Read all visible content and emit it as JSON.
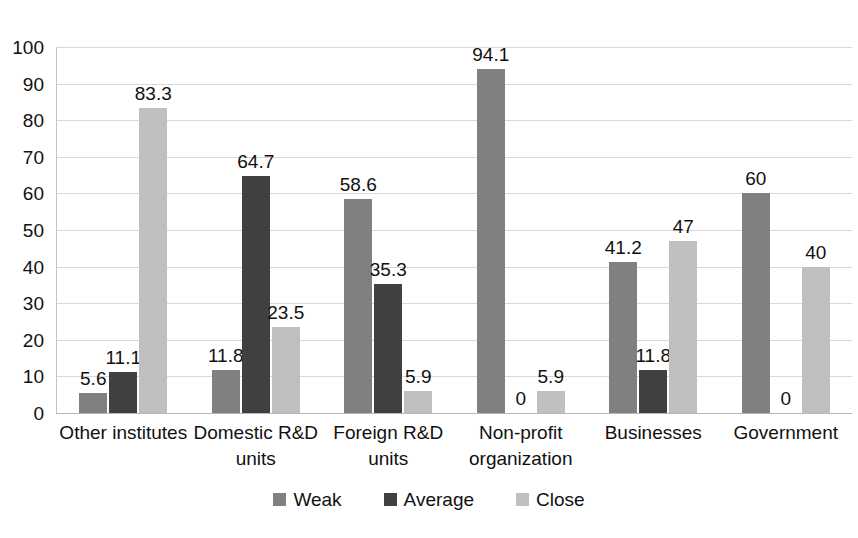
{
  "chart_data": {
    "type": "bar",
    "title": "",
    "subtitle": "",
    "xlabel": "",
    "ylabel": "",
    "ylim": [
      0,
      100
    ],
    "ytick_step": 10,
    "yticks": [
      "100",
      "90",
      "80",
      "70",
      "60",
      "50",
      "40",
      "30",
      "20",
      "10",
      "0"
    ],
    "grid": true,
    "legend_position": "bottom",
    "categories": [
      "Other institutes",
      "Domestic R&D units",
      "Foreign R&D units",
      "Non-profit organization",
      "Businesses",
      "Government"
    ],
    "category_lines": [
      [
        "Other institutes"
      ],
      [
        "Domestic R&D",
        "units"
      ],
      [
        "Foreign R&D",
        "units"
      ],
      [
        "Non-profit",
        "organization"
      ],
      [
        "Businesses"
      ],
      [
        "Government"
      ]
    ],
    "series": [
      {
        "name": "Weak",
        "color": "#808080",
        "values": [
          5.6,
          11.8,
          58.6,
          94.1,
          41.2,
          60
        ],
        "labels": [
          "5.6",
          "11.8",
          "58.6",
          "94.1",
          "41.2",
          "60"
        ]
      },
      {
        "name": "Average",
        "color": "#404040",
        "values": [
          11.1,
          64.7,
          35.3,
          0,
          11.8,
          0
        ],
        "labels": [
          "11.1",
          "64.7",
          "35.3",
          "0",
          "11.8",
          "0"
        ]
      },
      {
        "name": "Close",
        "color": "#bfbfbf",
        "values": [
          83.3,
          23.5,
          5.9,
          5.9,
          47,
          40
        ],
        "labels": [
          "83.3",
          "23.5",
          "5.9",
          "5.9",
          "47",
          "40"
        ]
      }
    ]
  },
  "legend": {
    "items": [
      {
        "label": "Weak",
        "color": "#808080"
      },
      {
        "label": "Average",
        "color": "#404040"
      },
      {
        "label": "Close",
        "color": "#bfbfbf"
      }
    ]
  },
  "colors": {
    "weak": "#808080",
    "average": "#404040",
    "close": "#bfbfbf",
    "gridline": "#d9d9d9",
    "text": "#111111",
    "background": "#ffffff"
  }
}
